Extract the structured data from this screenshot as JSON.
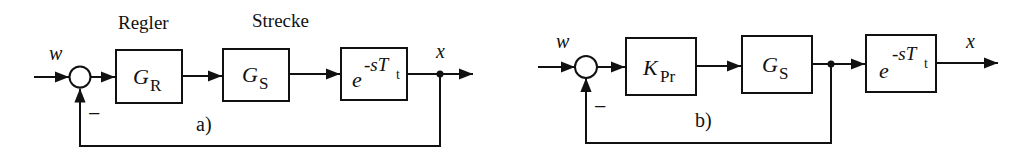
{
  "diagrams": [
    {
      "id": "a",
      "caption": "a)",
      "section_labels": {
        "controller": "Regler",
        "plant": "Strecke"
      },
      "input_label": "w",
      "output_label": "x",
      "feedback_sign": "−",
      "blocks": [
        {
          "name": "controller",
          "main": "G",
          "sub": "R"
        },
        {
          "name": "plant",
          "main": "G",
          "sub": "S"
        },
        {
          "name": "dead-time",
          "base": "e",
          "exp": "-sT",
          "exp_sub": "t"
        }
      ],
      "feedback_tap": "after dead-time (output x)"
    },
    {
      "id": "b",
      "caption": "b)",
      "input_label": "w",
      "output_label": "x",
      "feedback_sign": "−",
      "blocks": [
        {
          "name": "p-controller",
          "main": "K",
          "sub": "Pr"
        },
        {
          "name": "plant",
          "main": "G",
          "sub": "S"
        },
        {
          "name": "dead-time",
          "base": "e",
          "exp": "-sT",
          "exp_sub": "t"
        }
      ],
      "feedback_tap": "between G_S and dead-time"
    }
  ],
  "colors": {
    "stroke": "#111111",
    "background": "#ffffff"
  }
}
